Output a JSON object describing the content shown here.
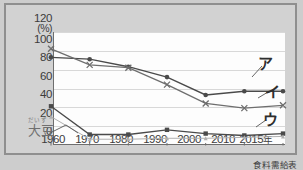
{
  "chart_data": {
    "type": "line",
    "title": "",
    "xlabel": "",
    "ylabel": "",
    "yunit": "(%)",
    "ylim": [
      0,
      120
    ],
    "ygrid": true,
    "yticks": [
      0,
      20,
      40,
      60,
      80,
      100,
      120
    ],
    "ytick_labels": [
      "0",
      "20",
      "40",
      "60",
      "80",
      "100",
      "120"
    ],
    "categories": [
      "1960",
      "1970",
      "1980",
      "1990",
      "2000",
      "2010",
      "2015"
    ],
    "xtick_labels": [
      "1960",
      "1970",
      "1980",
      "1990",
      "2000",
      "2010",
      "2015"
    ],
    "xtick_suffix": "年",
    "legend_position": "inline-right",
    "series": [
      {
        "name": "ア",
        "label": "ア",
        "marker": "dot",
        "color": "#4a4a4a",
        "values": [
          91,
          89,
          81,
          70,
          51,
          55,
          55
        ]
      },
      {
        "name": "イ",
        "label": "イ",
        "marker": "cross",
        "color": "#6e6e6e",
        "values": [
          100,
          83,
          80,
          62,
          42,
          37,
          40
        ]
      },
      {
        "name": "ウ",
        "label": "ウ",
        "marker": "square",
        "color": "#4a4a4a",
        "values": [
          39,
          9,
          9,
          14,
          10,
          8,
          10
        ]
      },
      {
        "name": "大豆",
        "label": "大豆",
        "ruby": "だいず",
        "marker": "small-triangle",
        "color": "#b0b0b0",
        "values": [
          28,
          4,
          4,
          5,
          5,
          6,
          7
        ]
      }
    ],
    "annotations": [
      {
        "name": "soybean-annotation",
        "text": "大豆",
        "ruby": "だいず"
      }
    ],
    "source": "食料需給表"
  }
}
